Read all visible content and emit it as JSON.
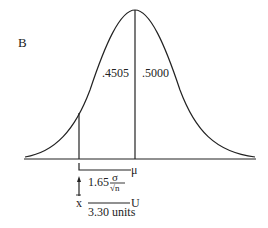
{
  "panel_label": "B",
  "areas": {
    "left": ".4505",
    "right": ".5000"
  },
  "mean_label": "μ",
  "formula": {
    "coef": "1.65",
    "num": "σ",
    "den": "√n"
  },
  "xbar_label": "x",
  "upper_label": "U",
  "width_label": "3.30 units"
}
